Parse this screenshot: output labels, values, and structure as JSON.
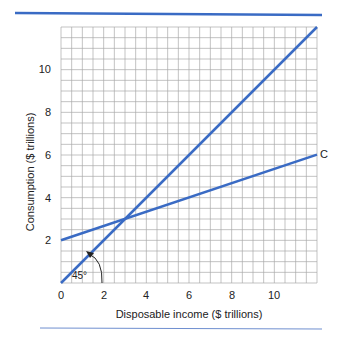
{
  "chart_data": {
    "type": "line",
    "title": "",
    "xlabel": "Disposable income ($ trillions)",
    "ylabel": "Consumption ($ trillions)",
    "xlim": [
      0,
      12
    ],
    "ylim": [
      0,
      12
    ],
    "grid": true,
    "grid_step": 0.5,
    "x_ticks": [
      "0",
      "2",
      "4",
      "6",
      "8",
      "10"
    ],
    "y_ticks": [
      "2",
      "4",
      "6",
      "8",
      "10"
    ],
    "series": [
      {
        "name": "45-degree line",
        "x": [
          0,
          12
        ],
        "y": [
          0,
          12
        ],
        "color": "#3a6bc4"
      },
      {
        "name": "C",
        "x": [
          0,
          12
        ],
        "y": [
          2,
          6
        ],
        "color": "#3a6bc4"
      }
    ],
    "annotations": [
      {
        "text": "45°",
        "x": 1.2,
        "y": 0.3
      },
      {
        "text": "C",
        "x": 12.2,
        "y": 6
      }
    ],
    "intersection": {
      "x": 3,
      "y": 3
    }
  },
  "labels": {
    "xlabel": "Disposable income ($ trillions)",
    "ylabel": "Consumption ($ trillions)",
    "x0": "0",
    "x2": "2",
    "x4": "4",
    "x6": "6",
    "x8": "8",
    "x10": "10",
    "y2": "2",
    "y4": "4",
    "y6": "6",
    "y8": "8",
    "y10": "10",
    "angle": "45°",
    "curve_label": "C"
  },
  "colors": {
    "accent": "#3a6bc4",
    "grid": "#a9a9a9"
  }
}
